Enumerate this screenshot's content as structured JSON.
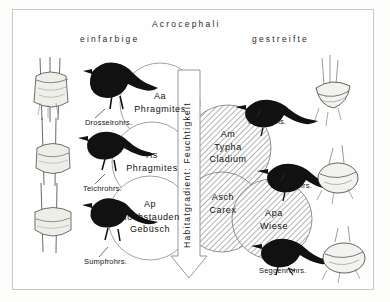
{
  "figure": {
    "title": "Acrocephali",
    "left_header": "einfarbige",
    "right_header": "gestreifte",
    "gradient_axis_label": "Habitatgradient: Feuchtigkeit"
  },
  "habitat_circles": {
    "unstriped": [
      {
        "code": "Aa",
        "lines": [
          "Aa",
          "Phragmites"
        ]
      },
      {
        "code": "As",
        "lines": [
          "As",
          "Phragmites"
        ]
      },
      {
        "code": "Ap",
        "lines": [
          "Ap",
          "Hochstauden",
          "Gebüsch"
        ]
      }
    ],
    "striped": [
      {
        "code": "Am",
        "lines": [
          "Am",
          "Typha",
          "Cladium"
        ]
      },
      {
        "code": "Asch",
        "lines": [
          "Asch",
          "Carex"
        ]
      },
      {
        "code": "Apa",
        "lines": [
          "Apa",
          "Wiese"
        ]
      }
    ]
  },
  "species_labels": {
    "left": [
      {
        "name": "Drosselrohrs."
      },
      {
        "name": "Teichrohrs."
      },
      {
        "name": "Sumpfrohrs."
      }
    ],
    "right": [
      {
        "name": "Mariskens."
      },
      {
        "name": "Schilfrohrs."
      },
      {
        "name": "Seggenrohrs."
      }
    ]
  },
  "icons": {
    "bird": "bird-silhouette-icon",
    "nest": "nest-illustration-icon",
    "arrow": "down-arrow-icon"
  },
  "colors": {
    "frame": "#c9c9c9",
    "ink": "#111111",
    "hatch": "#9a9a9a",
    "background": "#fefefe"
  }
}
